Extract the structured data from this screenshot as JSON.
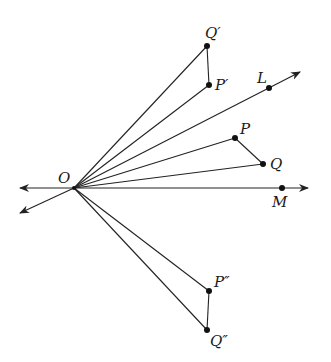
{
  "diagram": {
    "type": "geometric-transformation",
    "labels": {
      "O": "O",
      "Q1": "Q′",
      "P1": "P′",
      "L": "L",
      "P": "P",
      "Q": "Q",
      "M": "M",
      "P2": "P″",
      "Q2": "Q″"
    },
    "points": {
      "O": [
        74,
        188
      ],
      "Q1": [
        207,
        46
      ],
      "P1": [
        209,
        85
      ],
      "L": [
        269,
        88
      ],
      "P": [
        235,
        138
      ],
      "Q": [
        263,
        164
      ],
      "M": [
        282,
        188
      ],
      "P2": [
        209,
        291
      ],
      "Q2": [
        207,
        330
      ]
    },
    "colors": {
      "line": "#222222",
      "point": "#111111",
      "background": "#ffffff"
    }
  }
}
